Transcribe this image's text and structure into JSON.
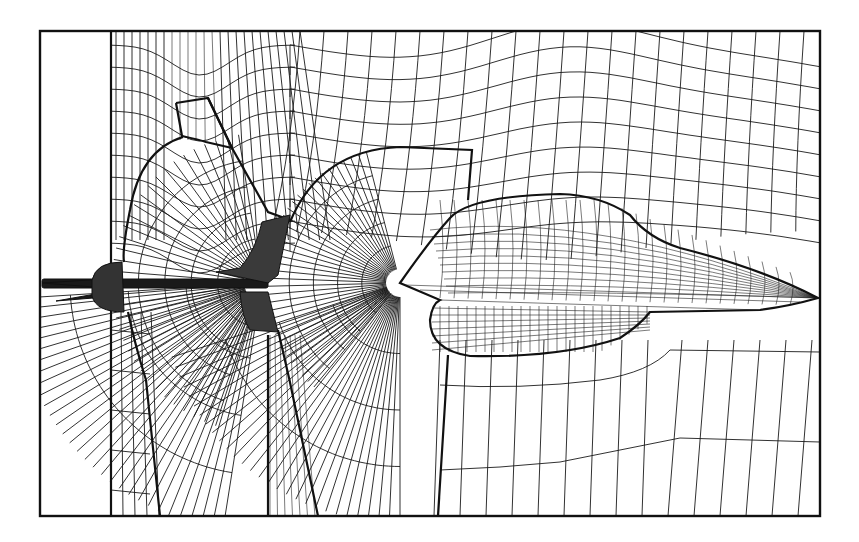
{
  "figure": {
    "colors": {
      "line": "#1a1a1a",
      "background": "#ffffff",
      "frame": "#111111"
    },
    "frame": {
      "x": 40,
      "y": 31,
      "width": 780,
      "height": 485
    },
    "left_strip_x": 111,
    "components": [
      {
        "name": "fuselage-nose",
        "tip": [
          818,
          298
        ]
      },
      {
        "name": "canopy-wing-body",
        "leading": [
          400,
          283
        ]
      },
      {
        "name": "engine-nacelle",
        "region": [
          428,
          300,
          660,
          358
        ]
      },
      {
        "name": "vertical-tail",
        "region": [
          215,
          215,
          290,
          335
        ]
      },
      {
        "name": "tail-cone",
        "region": [
          42,
          262,
          130,
          312
        ]
      },
      {
        "name": "upper-inlet-duct",
        "region": [
          175,
          31,
          230,
          140
        ]
      }
    ]
  }
}
